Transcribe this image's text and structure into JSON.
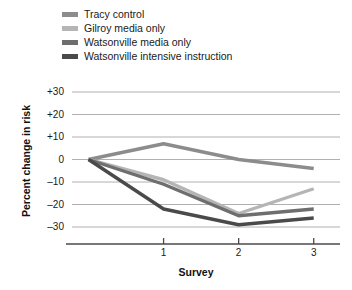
{
  "chart_data": {
    "type": "line",
    "title": "",
    "xlabel": "Survey",
    "ylabel": "Percent change in risk",
    "x": [
      0,
      1,
      2,
      3
    ],
    "xtick_labels": [
      "1",
      "2",
      "3"
    ],
    "xtick_values": [
      1,
      2,
      3
    ],
    "ytick_labels": [
      "+30",
      "+20",
      "+10",
      "0",
      "–10",
      "–20",
      "–30"
    ],
    "ytick_values": [
      30,
      20,
      10,
      0,
      -10,
      -20,
      -30
    ],
    "ylim": [
      -34,
      30
    ],
    "xlim": [
      -0.22,
      3.35
    ],
    "grid": "horizontal",
    "legend_position": "top-left",
    "series": [
      {
        "name": "Tracy control",
        "color": "#8c8c8c",
        "values": [
          0,
          7,
          0,
          -4
        ]
      },
      {
        "name": "Gilroy media only",
        "color": "#b5b5b5",
        "values": [
          0,
          -9,
          -24,
          -13
        ]
      },
      {
        "name": "Watsonville media only",
        "color": "#6e6e6e",
        "values": [
          0,
          -11,
          -25,
          -22
        ]
      },
      {
        "name": "Watsonville intensive instruction",
        "color": "#4a4a4a",
        "values": [
          0,
          -22,
          -29,
          -26
        ]
      }
    ]
  },
  "legend": {
    "items": [
      {
        "label": "Tracy control",
        "color": "#8c8c8c"
      },
      {
        "label": "Gilroy media only",
        "color": "#b5b5b5"
      },
      {
        "label": "Watsonville media only",
        "color": "#6e6e6e"
      },
      {
        "label": "Watsonville intensive instruction",
        "color": "#4a4a4a"
      }
    ]
  },
  "axes": {
    "y_title": "Percent change in risk",
    "x_title": "Survey",
    "y_ticks": [
      "+30",
      "+20",
      "+10",
      "0",
      "–10",
      "–20",
      "–30"
    ],
    "x_ticks": [
      "1",
      "2",
      "3"
    ]
  },
  "colors": {
    "grid": "#b0b0b0",
    "axis": "#4a4a4a",
    "text": "#1a1a1a",
    "background": "#ffffff"
  }
}
